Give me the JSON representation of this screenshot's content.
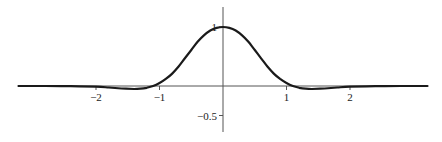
{
  "chart_data": {
    "type": "line",
    "title": "",
    "xlabel": "",
    "ylabel": "",
    "xlim": [
      -3.22,
      3.22
    ],
    "ylim": [
      -0.62,
      1.34
    ],
    "grid": false,
    "legend": null,
    "x_ticks": [
      {
        "value": -2,
        "label": "−2"
      },
      {
        "value": -1,
        "label": "−1"
      },
      {
        "value": 1,
        "label": "1"
      },
      {
        "value": 2,
        "label": "2"
      }
    ],
    "y_ticks": [
      {
        "value": 1,
        "label": "1"
      },
      {
        "value": -0.5,
        "label": "−0.5"
      }
    ],
    "series": [
      {
        "name": "curve",
        "color": "#1a1a1a",
        "x": [
          -3.22,
          -2.8,
          -2.4,
          -2.0,
          -1.8,
          -1.6,
          -1.4,
          -1.3,
          -1.2,
          -1.1,
          -1.0,
          -0.9,
          -0.8,
          -0.7,
          -0.6,
          -0.5,
          -0.4,
          -0.3,
          -0.2,
          -0.1,
          0.0,
          0.1,
          0.2,
          0.3,
          0.4,
          0.5,
          0.6,
          0.7,
          0.8,
          0.9,
          1.0,
          1.1,
          1.2,
          1.3,
          1.4,
          1.6,
          1.8,
          2.0,
          2.4,
          2.8,
          3.22
        ],
        "y": [
          0.0,
          0.0,
          -0.003,
          -0.012,
          -0.025,
          -0.042,
          -0.05,
          -0.045,
          -0.03,
          0.0,
          0.05,
          0.12,
          0.21,
          0.33,
          0.47,
          0.61,
          0.75,
          0.86,
          0.94,
          0.985,
          1.0,
          0.985,
          0.94,
          0.86,
          0.75,
          0.61,
          0.47,
          0.33,
          0.21,
          0.12,
          0.05,
          0.0,
          -0.03,
          -0.045,
          -0.05,
          -0.042,
          -0.025,
          -0.012,
          -0.003,
          0.0,
          0.0
        ]
      }
    ]
  },
  "layout": {
    "origin_px": [
      223,
      86
    ],
    "x_px_per_unit": 63.5,
    "y_px_per_unit": 59,
    "yaxis_top_px": 7,
    "yaxis_bottom_px": 132,
    "xaxis_left_px": 18,
    "xaxis_right_px": 427
  }
}
